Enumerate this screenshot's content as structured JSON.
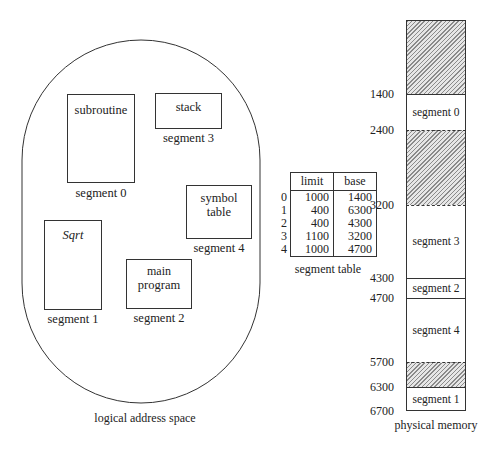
{
  "logical_space": {
    "caption": "logical address space",
    "segments": [
      {
        "name": "subroutine",
        "label": "segment 0"
      },
      {
        "name": "Sqrt",
        "label": "segment 1"
      },
      {
        "name_line1": "main",
        "name_line2": "program",
        "label": "segment 2"
      },
      {
        "name": "stack",
        "label": "segment 3"
      },
      {
        "name_line1": "symbol",
        "name_line2": "table",
        "label": "segment 4"
      }
    ]
  },
  "segment_table": {
    "caption": "segment table",
    "headers": {
      "limit": "limit",
      "base": "base"
    },
    "rows": [
      {
        "index": "0",
        "limit": "1000",
        "base": "1400"
      },
      {
        "index": "1",
        "limit": "400",
        "base": "6300"
      },
      {
        "index": "2",
        "limit": "400",
        "base": "4300"
      },
      {
        "index": "3",
        "limit": "1100",
        "base": "3200"
      },
      {
        "index": "4",
        "limit": "1000",
        "base": "4700"
      }
    ]
  },
  "physical_memory": {
    "caption": "physical memory",
    "addresses": [
      "1400",
      "2400",
      "3200",
      "4300",
      "4700",
      "5700",
      "6300",
      "6700"
    ],
    "blocks": [
      {
        "label": "",
        "type": "free"
      },
      {
        "label": "segment 0",
        "type": "segment"
      },
      {
        "label": "",
        "type": "free"
      },
      {
        "label": "segment 3",
        "type": "segment"
      },
      {
        "label": "segment 2",
        "type": "segment"
      },
      {
        "label": "segment 4",
        "type": "segment"
      },
      {
        "label": "",
        "type": "free"
      },
      {
        "label": "segment 1",
        "type": "segment"
      }
    ]
  }
}
